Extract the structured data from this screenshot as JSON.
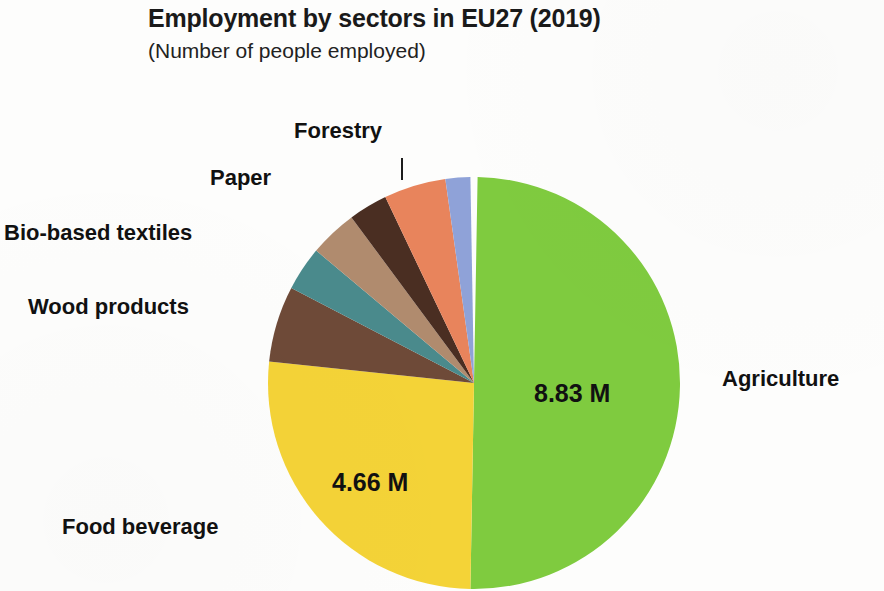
{
  "header": {
    "title": "Employment by sectors in EU27 (2019)",
    "subtitle": "(Number of people employed)"
  },
  "labels": {
    "forestry": "Forestry",
    "paper": "Paper",
    "bio_based_textiles": "Bio-based textiles",
    "wood_products": "Wood products",
    "food_beverage": "Food beverage",
    "agriculture": "Agriculture"
  },
  "value_labels": {
    "agriculture": "8.83 M",
    "food_beverage": "4.66 M"
  },
  "colors": {
    "agriculture": "#7FCB3F",
    "food_beverage": "#F4D337",
    "wood_products": "#6E4A38",
    "bio_based_textiles": "#4A8A8C",
    "paper": "#B08B6E",
    "forestry": "#4A2E22",
    "slice_salmon": "#E8845C",
    "slice_periwinkle": "#8FA2D8",
    "slice_olive": "#6B6B42",
    "title_text": "#1a1a1a",
    "label_text": "#111111",
    "background": "#fdfdfc"
  },
  "chart_data": {
    "type": "pie",
    "title": "Employment by sectors in EU27 (2019)",
    "subtitle": "(Number of people employed)",
    "unit": "millions of people employed",
    "value_suffix": " M",
    "start_angle_deg": 0,
    "direction": "clockwise",
    "legend": "labels placed outside slices with leader line for Forestry",
    "labels": [
      "Agriculture",
      "Food beverage",
      "Wood products",
      "Bio-based textiles",
      "Paper",
      "Forestry",
      "",
      ""
    ],
    "values": [
      8.83,
      4.66,
      1.05,
      0.62,
      0.66,
      0.53,
      0.3,
      0.08
    ],
    "displayed_values": [
      "8.83 M",
      "4.66 M",
      "",
      "",
      "",
      "",
      "",
      ""
    ],
    "colors": [
      "#7FCB3F",
      "#F4D337",
      "#6E4A38",
      "#4A8A8C",
      "#B08B6E",
      "#4A2E22",
      "#E8845C",
      "#8FA2D8"
    ],
    "slices": [
      {
        "label": "Agriculture",
        "value": 8.83,
        "display": "8.83 M",
        "color": "#7FCB3F",
        "start_deg": 1.0,
        "end_deg": 181.0
      },
      {
        "label": "Food beverage",
        "value": 4.66,
        "display": "4.66 M",
        "color": "#F4D337",
        "start_deg": 181.0,
        "end_deg": 276.0
      },
      {
        "label": "Wood products",
        "value": 1.05,
        "display": "",
        "color": "#6E4A38",
        "start_deg": 276.0,
        "end_deg": 297.5
      },
      {
        "label": "Bio-based textiles",
        "value": 0.62,
        "display": "",
        "color": "#4A8A8C",
        "start_deg": 297.5,
        "end_deg": 310.0
      },
      {
        "label": "Paper",
        "value": 0.66,
        "display": "",
        "color": "#B08B6E",
        "start_deg": 310.0,
        "end_deg": 323.5
      },
      {
        "label": "Forestry",
        "value": 0.53,
        "display": "",
        "color": "#4A2E22",
        "start_deg": 323.5,
        "end_deg": 334.5
      },
      {
        "label": "",
        "value": 0.3,
        "display": "",
        "color": "#E8845C",
        "start_deg": 334.5,
        "end_deg": 352.0
      },
      {
        "label": "",
        "value": 0.08,
        "display": "",
        "color": "#8FA2D8",
        "start_deg": 352.0,
        "end_deg": 359.0
      }
    ],
    "geometry": {
      "center_x": 474,
      "center_y": 383,
      "radius": 206
    }
  }
}
